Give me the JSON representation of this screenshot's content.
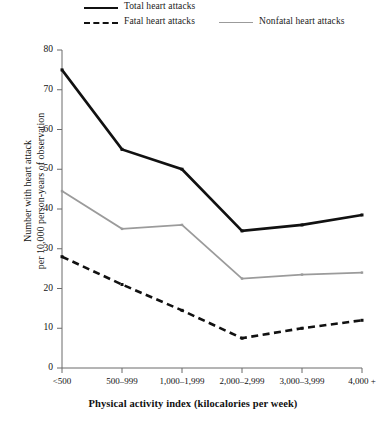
{
  "chart_data": {
    "type": "line",
    "title": "",
    "xlabel": "Physical activity index (kilocalories per week)",
    "ylabel": "Number with heart attack per 10,000 person-years of observation",
    "ylabel_line1": "Number with heart attack",
    "ylabel_line2": "per 10,000 person-years of observation",
    "categories": [
      "<500",
      "500–999",
      "1,000–1,999",
      "2,000–2,999",
      "3,000–3,999",
      "4,000 +"
    ],
    "yticks": [
      0,
      10,
      20,
      30,
      40,
      50,
      60,
      70,
      80
    ],
    "ylim": [
      0,
      80
    ],
    "grid": false,
    "legend_position": "top",
    "series": [
      {
        "name": "Total heart attacks",
        "style": "solid",
        "color": "#111111",
        "values": [
          75,
          55,
          50,
          34.5,
          36,
          38.5
        ]
      },
      {
        "name": "Fatal heart attacks",
        "style": "dashed",
        "color": "#111111",
        "values": [
          28,
          21,
          14.5,
          7.5,
          10,
          12
        ]
      },
      {
        "name": "Nonfatal heart attacks",
        "style": "solid",
        "color": "#9b9b9b",
        "values": [
          44.5,
          35,
          36,
          22.5,
          23.5,
          24
        ]
      }
    ]
  },
  "legend": {
    "items": [
      {
        "label": "Total heart attacks"
      },
      {
        "label": "Fatal heart attacks"
      },
      {
        "label": "Nonfatal heart attacks"
      }
    ]
  },
  "colors": {
    "total": "#111111",
    "fatal": "#111111",
    "nonfatal": "#9b9b9b",
    "axis": "#6b6b6b",
    "background": "#ffffff"
  }
}
